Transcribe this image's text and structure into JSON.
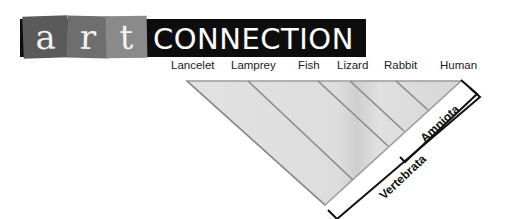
{
  "logo": {
    "letters": [
      "a",
      "r",
      "t"
    ],
    "word": "CONNECTION"
  },
  "taxa": [
    {
      "label": "Lancelet",
      "x": 171
    },
    {
      "label": "Lamprey",
      "x": 231
    },
    {
      "label": "Fish",
      "x": 298
    },
    {
      "label": "Lizard",
      "x": 337
    },
    {
      "label": "Rabbit",
      "x": 384
    },
    {
      "label": "Human",
      "x": 440
    }
  ],
  "clades": [
    {
      "label": "Amniota"
    },
    {
      "label": "Vertebrata"
    }
  ],
  "colors": {
    "triangle_fill": "#dcdcdc",
    "branch_line": "#8a8a8a",
    "bracket": "#111111",
    "logo_band": "#0d0d0d"
  }
}
